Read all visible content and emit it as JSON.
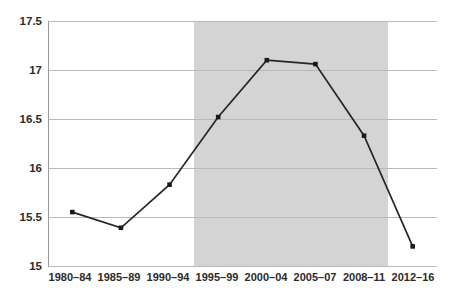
{
  "chart_data": {
    "type": "line",
    "title": "",
    "subtitle": "",
    "xlabel": "",
    "ylabel": "",
    "categories": [
      "1980–84",
      "1985–89",
      "1990–94",
      "1995–99",
      "2000–04",
      "2005–07",
      "2008–11",
      "2012–16"
    ],
    "values": [
      15.55,
      15.39,
      15.83,
      16.52,
      17.1,
      17.06,
      16.33,
      15.2
    ],
    "series": [
      {
        "name": "",
        "values": [
          15.55,
          15.39,
          15.83,
          16.52,
          17.1,
          17.06,
          16.33,
          15.2
        ]
      }
    ],
    "ylim": [
      15,
      17.5
    ],
    "y_ticks": [
      15,
      15.5,
      16,
      16.5,
      17,
      17.5
    ],
    "y_tick_labels": [
      "15",
      "15.5",
      "16",
      "16.5",
      "17",
      "17.5"
    ],
    "x_tick_labels": [
      "1980–84",
      "1985–89",
      "1990–94",
      "1995–99",
      "2000–04",
      "2005–07",
      "2008–11",
      "2012–16"
    ],
    "grid": true,
    "legend": false,
    "legend_position": "none",
    "marker": "square",
    "line_color": "#262626",
    "marker_color": "#1a1a1a",
    "gridline_color": "#b9b9b9",
    "background_color": "#ffffff",
    "shaded_region": {
      "label": "",
      "start_category": "1995–99",
      "end_category": "2008–11",
      "color": "#d4d4d4"
    },
    "annotations": []
  }
}
